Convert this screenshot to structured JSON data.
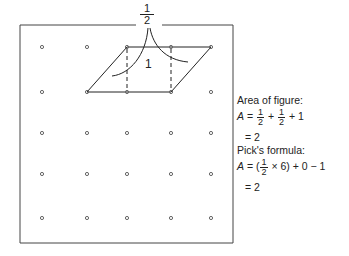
{
  "figure": {
    "half_label_numerator": "1",
    "half_label_denominator": "2",
    "inner_unit_label": "1",
    "grid": {
      "columns_x": [
        42,
        87,
        127,
        171,
        211
      ],
      "rows_y": [
        47,
        92,
        133,
        174,
        218
      ]
    },
    "parallelogram_vertices": [
      [
        87,
        92
      ],
      [
        127,
        47
      ],
      [
        211,
        47
      ],
      [
        171,
        92
      ]
    ],
    "dot_color": "#666666",
    "line_color": "#222222"
  },
  "notes": {
    "area_heading": "Area of figure:",
    "area_lhs": "A",
    "area_eq": " = ",
    "area_plus1": " + ",
    "area_plus2": " + 1",
    "half_num": "1",
    "half_den": "2",
    "area_result": "= 2",
    "pick_heading": "Pick's formula:",
    "pick_lhs": "A",
    "pick_eq": " = (",
    "pick_times": " × 6) + 0 − 1",
    "pick_result": "= 2"
  }
}
